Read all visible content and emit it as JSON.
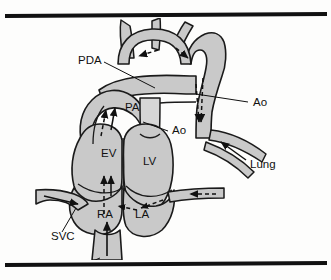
{
  "figure": {
    "colors": {
      "vessel_fill": "#c9c9c9",
      "vessel_fill_light": "#d6d6d6",
      "outline": "#1a1a1a",
      "rule": "#111111",
      "background": "#fdfdfc",
      "label_text": "#111111"
    },
    "rules": {
      "top": "top-divider-rule",
      "bottom": "bottom-divider-rule"
    },
    "labels": [
      {
        "id": "pda",
        "text": "PDA",
        "x": 78,
        "y": 46
      },
      {
        "id": "pa",
        "text": "PA",
        "x": 125,
        "y": 93
      },
      {
        "id": "ao-upper",
        "text": "Ao",
        "x": 253,
        "y": 88
      },
      {
        "id": "ao-root",
        "text": "Ao",
        "x": 172,
        "y": 116
      },
      {
        "id": "ev",
        "text": "EV",
        "x": 101,
        "y": 139
      },
      {
        "id": "lv",
        "text": "LV",
        "x": 143,
        "y": 147
      },
      {
        "id": "lung",
        "text": "Lung",
        "x": 250,
        "y": 150
      },
      {
        "id": "ra",
        "text": "RA",
        "x": 97,
        "y": 200
      },
      {
        "id": "la",
        "text": "LA",
        "x": 135,
        "y": 200
      },
      {
        "id": "svc",
        "text": "SVC",
        "x": 51,
        "y": 222
      },
      {
        "id": "ivc",
        "text": "IVC",
        "x": 62,
        "y": 253
      }
    ],
    "structures": [
      {
        "id": "aortic-arch",
        "name": "aortic arch with head and neck vessels"
      },
      {
        "id": "pulmonary-artery",
        "name": "main pulmonary artery"
      },
      {
        "id": "pda-duct",
        "name": "patent ductus arteriosus"
      },
      {
        "id": "descending-aorta",
        "name": "descending aorta"
      },
      {
        "id": "pulmonary-vessels",
        "name": "pulmonary vessels to lung"
      },
      {
        "id": "right-ventricle",
        "name": "right ventricle EV"
      },
      {
        "id": "left-ventricle",
        "name": "left ventricle LV"
      },
      {
        "id": "right-atrium",
        "name": "right atrium RA"
      },
      {
        "id": "left-atrium",
        "name": "left atrium LA"
      },
      {
        "id": "superior-vena-cava",
        "name": "superior vena cava"
      },
      {
        "id": "inferior-vena-cava",
        "name": "inferior vena cava"
      },
      {
        "id": "pulmonary-vein",
        "name": "pulmonary vein to left atrium"
      }
    ],
    "flow_arrows": [
      {
        "id": "arch-flow-left",
        "style": "dashed",
        "direction": "left"
      },
      {
        "id": "arch-flow-right",
        "style": "dashed",
        "direction": "down"
      },
      {
        "id": "pa-outflow",
        "style": "dashed",
        "direction": "up"
      },
      {
        "id": "pda-shunt",
        "style": "dashed",
        "direction": "down"
      },
      {
        "id": "descending-flow",
        "style": "dashed",
        "direction": "down"
      },
      {
        "id": "lung-inflow",
        "style": "solid",
        "direction": "down-right"
      },
      {
        "id": "svc-inflow",
        "style": "solid",
        "direction": "right"
      },
      {
        "id": "ivc-inflow",
        "style": "solid",
        "direction": "up"
      },
      {
        "id": "ra-to-rv",
        "style": "dashed",
        "direction": "up"
      },
      {
        "id": "atrial-shunt",
        "style": "dashed",
        "direction": "left"
      },
      {
        "id": "pulmonary-vein-in",
        "style": "dashed",
        "direction": "left"
      }
    ]
  }
}
